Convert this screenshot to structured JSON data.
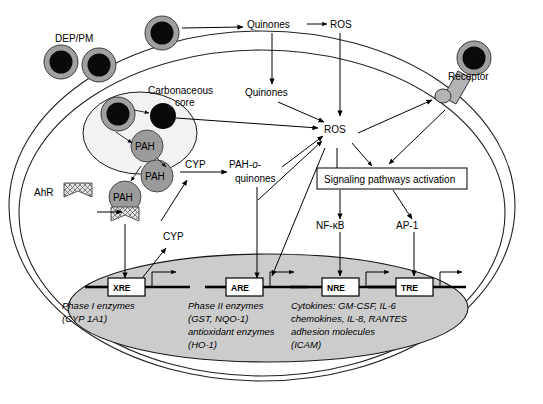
{
  "diagram": {
    "outside_labels": {
      "dep_pm": "DEP/PM",
      "quinones_out": "Quinones",
      "ros_out": "ROS",
      "receptor": "Receptor"
    },
    "cell_labels": {
      "carbonaceous_core": "Carbonaceous core",
      "carbonaceous_core_line1": "Carbonaceous",
      "carbonaceous_core_line2": "core",
      "pah": "PAH",
      "ahr": "AhR",
      "cyp_top": "CYP",
      "cyp_bottom": "CYP",
      "pah_o_quinones_line1_a": "PAH-",
      "pah_o_quinones_line1_b": "o",
      "pah_o_quinones_line1_c": "-",
      "pah_o_quinones_line2": "quinones",
      "quinones_in": "Quinones",
      "ros_in": "ROS",
      "signaling_box": "Signaling pathways activation",
      "nfkb": "NF-κB",
      "ap1": "AP-1"
    },
    "response_elements": [
      {
        "name": "XRE",
        "genes": [
          "Phase I enzymes",
          "(CYP 1A1)"
        ]
      },
      {
        "name": "ARE",
        "genes": [
          "Phase II enzymes",
          "(GST, NQO-1)",
          "antioxidant enzymes",
          "(HO-1)"
        ]
      },
      {
        "name": "NRE",
        "genes": [
          "Cytokines: GM-CSF, IL-6",
          "chemokines, IL-8, RANTES",
          "adhesion molecules",
          "(ICAM)"
        ]
      },
      {
        "name": "TRE",
        "genes": []
      }
    ],
    "colors": {
      "nucleus_fill": "#cccccc",
      "particle_core": "#0a0a0a",
      "particle_shell": "#a0a0a0",
      "pah_fill": "#9b9b9b",
      "vesicle_fill": "#f2f2f2",
      "stroke": "#000000",
      "background": "#ffffff"
    }
  }
}
